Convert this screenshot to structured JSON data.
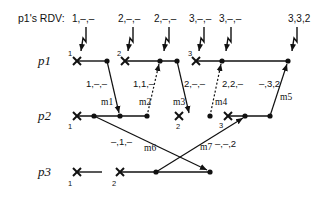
{
  "header": {
    "rdv_label": "p1's RDV:"
  },
  "processes": [
    {
      "name": "p1"
    },
    {
      "name": "p2"
    },
    {
      "name": "p3"
    }
  ],
  "rdv_values": [
    "1,–,–",
    "2,–,–",
    "2,–,–",
    "3,–,–",
    "3,–,–",
    "3,3,2"
  ],
  "checkpoints": {
    "p1": [
      "1",
      "2",
      "3"
    ],
    "p2": [
      "1",
      "2",
      "3"
    ],
    "p3": [
      "1",
      "2"
    ]
  },
  "messages": [
    {
      "id": "m1",
      "label": "m1",
      "vector": "1,–,–",
      "style": "solid"
    },
    {
      "id": "m2",
      "label": "m2",
      "vector": "1,1,–",
      "style": "dotted"
    },
    {
      "id": "m3",
      "label": "m3",
      "vector": "2,–,–",
      "style": "solid"
    },
    {
      "id": "m4",
      "label": "m4",
      "vector": "2,2,–",
      "style": "dotted"
    },
    {
      "id": "m5",
      "label": "m5",
      "vector": "–,3,2",
      "style": "solid"
    },
    {
      "id": "m6",
      "label": "m6",
      "vector": "–,1,–",
      "style": "solid"
    },
    {
      "id": "m7",
      "label": "m7",
      "vector": "–,–,2",
      "style": "solid"
    }
  ],
  "colors": {
    "ink": "#111111",
    "background": "#ffffff"
  }
}
